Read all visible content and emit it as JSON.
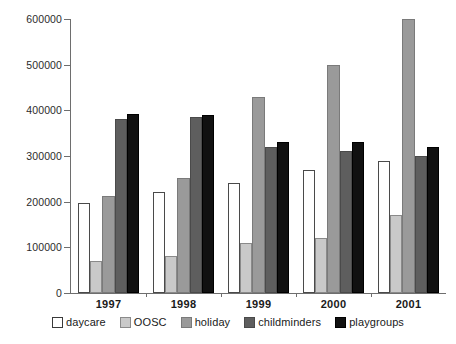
{
  "chart_data": {
    "type": "bar",
    "title": "",
    "xlabel": "",
    "ylabel": "",
    "ylim": [
      0,
      600000
    ],
    "ytick_labels": [
      "0",
      "100000",
      "200000",
      "300000",
      "400000",
      "500000",
      "600000"
    ],
    "yticks": [
      0,
      100000,
      200000,
      300000,
      400000,
      500000,
      600000
    ],
    "grid": false,
    "legend_position": "bottom",
    "categories": [
      "1997",
      "1998",
      "1999",
      "2000",
      "2001"
    ],
    "series": [
      {
        "name": "daycare",
        "color": "#ffffff",
        "values": [
          197000,
          221000,
          241000,
          270000,
          290000
        ]
      },
      {
        "name": "OOSC",
        "color": "#c9c9c9",
        "values": [
          71000,
          81000,
          110000,
          120000,
          171000
        ]
      },
      {
        "name": "holiday",
        "color": "#9a9a9a",
        "values": [
          212000,
          251000,
          430000,
          499000,
          600000
        ]
      },
      {
        "name": "childminders",
        "color": "#5e5e5e",
        "values": [
          381000,
          385000,
          320000,
          310000,
          300000
        ]
      },
      {
        "name": "playgroups",
        "color": "#111111",
        "values": [
          391000,
          390000,
          330000,
          330000,
          320000
        ]
      }
    ]
  },
  "legend": {
    "items": [
      {
        "label": "daycare",
        "key": "s-daycare"
      },
      {
        "label": "OOSC",
        "key": "s-oosc"
      },
      {
        "label": "holiday",
        "key": "s-holiday"
      },
      {
        "label": "childminders",
        "key": "s-childminders"
      },
      {
        "label": "playgroups",
        "key": "s-playgroups"
      }
    ]
  }
}
